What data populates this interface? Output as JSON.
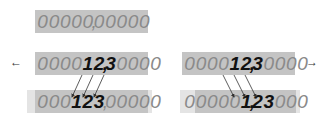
{
  "colors": {
    "box_fill": "#c4c4c4",
    "box_fill_light": "#e4e4e4",
    "digit_color": "#8a8a8a",
    "highlight_digit_color": "#111111",
    "arrow_color": "#333333"
  },
  "top": {
    "digits": [
      "0",
      "0",
      "0",
      "0",
      "0",
      ",",
      "0",
      "0",
      "0",
      "0",
      "0"
    ],
    "label": "00000,00000"
  },
  "left": {
    "direction_arrow": "←",
    "direction": "left",
    "before": {
      "digits": [
        "0",
        "0",
        "0",
        "0",
        "1",
        "2",
        ",",
        "3",
        "0",
        "0",
        "0",
        "0"
      ],
      "label": "0000 12,3 0000"
    },
    "after": {
      "digits": [
        "0",
        "0",
        "0",
        "1",
        "2",
        "3",
        ",",
        "0",
        "0",
        "0",
        "0",
        "0"
      ],
      "label": "000 123, 00000"
    }
  },
  "right": {
    "direction_arrow": "→",
    "direction": "right",
    "before": {
      "digits": [
        "0",
        "0",
        "0",
        "0",
        "1",
        "2",
        ",",
        "3",
        "0",
        "0",
        "0",
        "0"
      ],
      "label": "0000 12,3 0000"
    },
    "after": {
      "digits": [
        "0",
        "0",
        "0",
        "0",
        "0",
        "1",
        ",",
        "2",
        "3",
        "0",
        "0",
        "0"
      ],
      "label": "00000 1,23 000"
    }
  },
  "icons": {
    "left_arrow": "arrow-left-icon",
    "right_arrow": "arrow-right-icon"
  }
}
